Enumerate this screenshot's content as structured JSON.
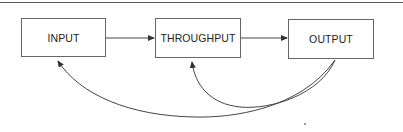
{
  "diagram": {
    "type": "flow",
    "nodes": [
      {
        "id": "input",
        "label": "INPUT"
      },
      {
        "id": "throughput",
        "label": "THROUGHPUT"
      },
      {
        "id": "output",
        "label": "OUTPUT"
      }
    ],
    "edges": [
      {
        "from": "input",
        "to": "throughput",
        "style": "straight"
      },
      {
        "from": "throughput",
        "to": "output",
        "style": "straight"
      },
      {
        "from": "output",
        "to": "throughput",
        "style": "curved-feedback"
      },
      {
        "from": "output",
        "to": "input",
        "style": "curved-feedback"
      }
    ],
    "colors": {
      "line": "#444444",
      "box_border": "#666666",
      "text": "#222222",
      "background": "#ffffff"
    }
  }
}
